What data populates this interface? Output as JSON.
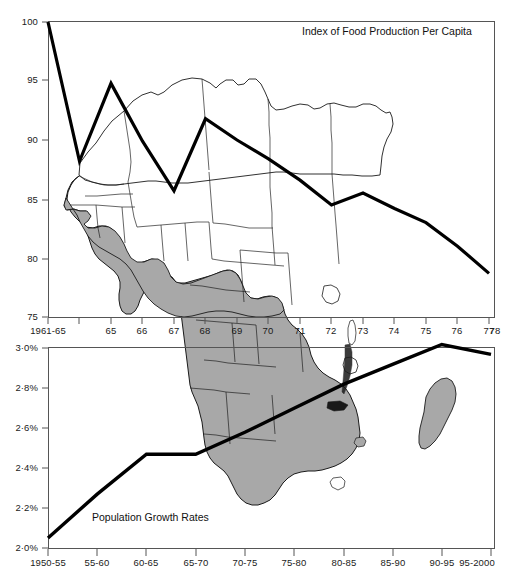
{
  "figure": {
    "title_top": "Index of Food Production Per Capita",
    "title_bottom": "Population Growth Rates",
    "background_map": "africa-map",
    "line_color": "#000000",
    "map_fill": "#a8a8a8",
    "map_stroke": "#1a1a1a",
    "axis_color": "#555555"
  },
  "chart_data": [
    {
      "type": "line",
      "id": "food-production",
      "title": "Index of Food Production Per Capita",
      "xlabel": "",
      "ylabel": "",
      "ylim": [
        75,
        100
      ],
      "yticks": [
        75,
        80,
        85,
        90,
        95,
        100
      ],
      "ytick_labels": [
        "75",
        "80",
        "85",
        "90",
        "95",
        "100"
      ],
      "categories": [
        "1961-65",
        "65",
        "66",
        "67",
        "68",
        "69",
        "70",
        "71",
        "72",
        "73",
        "74",
        "75",
        "76",
        "77",
        "78"
      ],
      "values": [
        100.0,
        88.2,
        94.8,
        89.9,
        85.7,
        91.8,
        90.0,
        88.4,
        86.6,
        84.5,
        85.5,
        84.2,
        83.0,
        81.0,
        78.7
      ],
      "grid": false,
      "legend": "none",
      "annotation": "Index of Food Production Per Capita"
    },
    {
      "type": "line",
      "id": "population-growth",
      "title": "Population Growth Rates",
      "xlabel": "",
      "ylabel": "",
      "ylim": [
        2.0,
        3.05
      ],
      "yticks": [
        2.0,
        2.2,
        2.4,
        2.6,
        2.8,
        3.0
      ],
      "ytick_labels": [
        "2·0%",
        "2·2%",
        "2·4%",
        "2·6%",
        "2·8%",
        "3·0%"
      ],
      "categories": [
        "1950-55",
        "55-60",
        "60-65",
        "65-70",
        "70-75",
        "75-80",
        "80-85",
        "85-90",
        "90-95",
        "95-2000"
      ],
      "values": [
        2.05,
        2.27,
        2.47,
        2.47,
        2.58,
        2.7,
        2.82,
        2.92,
        3.02,
        2.97
      ],
      "grid": false,
      "legend": "none",
      "annotation": "Population Growth Rates"
    }
  ],
  "axes": {
    "top": {
      "ytick_labels": [
        "100",
        "95",
        "90",
        "85",
        "80",
        "75"
      ],
      "xtick_labels": [
        "1961-65",
        "65",
        "66",
        "67",
        "68",
        "69",
        "70",
        "71",
        "72",
        "73",
        "74",
        "75",
        "76",
        "77",
        "78"
      ]
    },
    "bottom": {
      "ytick_labels": [
        "3·0%",
        "2·8%",
        "2·6%",
        "2·4%",
        "2·2%",
        "2·0%"
      ],
      "xtick_labels": [
        "1950-55",
        "55-60",
        "60-65",
        "65-70",
        "70-75",
        "75-80",
        "80-85",
        "85-90",
        "90-95",
        "95-2000"
      ]
    }
  }
}
